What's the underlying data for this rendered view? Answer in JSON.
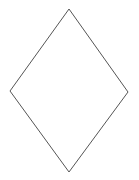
{
  "canvas": {
    "width": 139,
    "height": 180,
    "background_color": "#ffffff",
    "description": "A single unfilled rhombus (diamond) outline centered on a plain white background."
  },
  "figure": {
    "name": "rhombus",
    "label": "Rhombus",
    "shape_type": "quadrilateral",
    "sides": 4,
    "fill": "none",
    "stroke_color": "#555555",
    "stroke_width": 1,
    "vertices": [
      {
        "name": "top-vertex",
        "x": 69,
        "y": 9
      },
      {
        "name": "right-vertex",
        "x": 128,
        "y": 92
      },
      {
        "name": "bottom-vertex",
        "x": 69,
        "y": 172
      },
      {
        "name": "left-vertex",
        "x": 10,
        "y": 91
      }
    ],
    "points_attr": "69,9 128,92 69,172 10,91",
    "bounding_box": {
      "x": 10,
      "y": 9,
      "width": 118,
      "height": 163
    },
    "horizontal_diagonal": 118,
    "vertical_diagonal": 163
  }
}
